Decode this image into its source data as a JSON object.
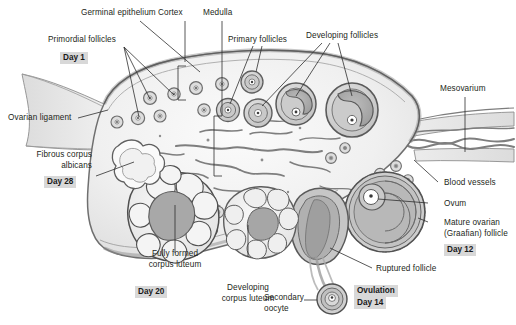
{
  "figure": {
    "kind": "anatomy-diagram",
    "size": {
      "width": 516,
      "height": 325
    }
  },
  "palette": {
    "background": "#ffffff",
    "text": "#231f20",
    "leader_line": "#3a3a3a",
    "outline": "#6f6f6f",
    "outline_dark": "#4a4a4a",
    "stroma_light": "#f2f2f2",
    "stroma_mid": "#e2e2e2",
    "cortex_band": "#cfcfcf",
    "capsule": "#9a9a9a",
    "follicle_wall": "#b4b4b4",
    "follicle_fill": "#d5d5d5",
    "antrum": "#a9a9a9",
    "vessel": "#8a8a8a",
    "highlight_box": "#d8d8d8"
  },
  "labels": {
    "germinal_epithelium": "Germinal epithelium",
    "cortex": "Cortex",
    "medulla": "Medulla",
    "primordial_follicles": "Primordial follicles",
    "primary_follicles": "Primary follicles",
    "developing_follicles": "Developing follicles",
    "mesovarium": "Mesovarium",
    "ovarian_ligament": "Ovarian ligament",
    "fibrous_corpus_albicans_l1": "Fibrous corpus",
    "fibrous_corpus_albicans_l2": "albicans",
    "blood_vessels": "Blood vessels",
    "ovum": "Ovum",
    "mature_follicle_l1": "Mature ovarian",
    "mature_follicle_l2": "(Graafian) follicle",
    "ruptured_follicle": "Ruptured follicle",
    "fully_formed_cl_l1": "Fully formed",
    "fully_formed_cl_l2": "corpus luteum",
    "developing_cl_l1": "Developing",
    "developing_cl_l2": "corpus luteum",
    "secondary_oocyte_l1": "Secondary",
    "secondary_oocyte_l2": "oocyte",
    "ovulation": "Ovulation"
  },
  "day_markers": {
    "day1": "Day 1",
    "day28": "Day 28",
    "day20": "Day 20",
    "day12": "Day 12",
    "day14": "Day 14"
  },
  "structures": [
    {
      "name": "germinal-epithelium",
      "description": "outer epithelial capsule layer of the ovary"
    },
    {
      "name": "cortex",
      "description": "outer zone containing follicles, marked by bracket"
    },
    {
      "name": "medulla",
      "description": "inner zone containing blood vessels, marked by bracket"
    },
    {
      "name": "primordial-follicles",
      "description": "small follicles with single oocyte, Day 1"
    },
    {
      "name": "primary-follicles",
      "description": "follicles with thickened granulosa layer"
    },
    {
      "name": "developing-follicles",
      "description": "secondary follicles with crescent antrum"
    },
    {
      "name": "mature-graafian-follicle",
      "description": "large follicle with ovum, Day 12"
    },
    {
      "name": "ruptured-follicle",
      "description": "follicle releasing oocyte at ovulation"
    },
    {
      "name": "secondary-oocyte",
      "description": "released oocyte, Day 14"
    },
    {
      "name": "developing-corpus-luteum",
      "description": "lobed luteal body forming after ovulation"
    },
    {
      "name": "fully-formed-corpus-luteum",
      "description": "mature scalloped corpus luteum, Day 20"
    },
    {
      "name": "fibrous-corpus-albicans",
      "description": "regressed scar tissue, Day 28"
    },
    {
      "name": "ovarian-ligament",
      "description": "tapering band at left attaching ovary"
    },
    {
      "name": "mesovarium",
      "description": "peritoneal fold at right carrying vessels"
    },
    {
      "name": "blood-vessels",
      "description": "intertwined vessels entering through mesovarium"
    }
  ]
}
